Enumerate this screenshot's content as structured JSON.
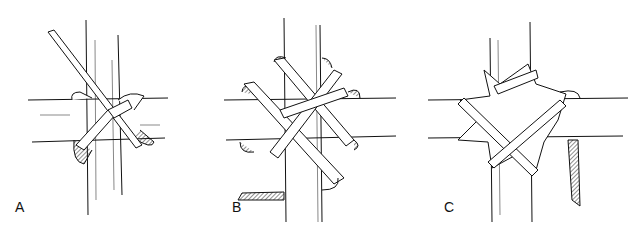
{
  "figure": {
    "panels": [
      {
        "id": "A",
        "label": "A",
        "caption": "first wrap of lashing strip"
      },
      {
        "id": "B",
        "label": "B",
        "caption": "multiple diagonal wraps"
      },
      {
        "id": "C",
        "label": "C",
        "caption": "finished lashing with loose end"
      }
    ]
  },
  "colors": {
    "ink": "#111111",
    "paper": "#ffffff",
    "hatch": "#333333"
  }
}
